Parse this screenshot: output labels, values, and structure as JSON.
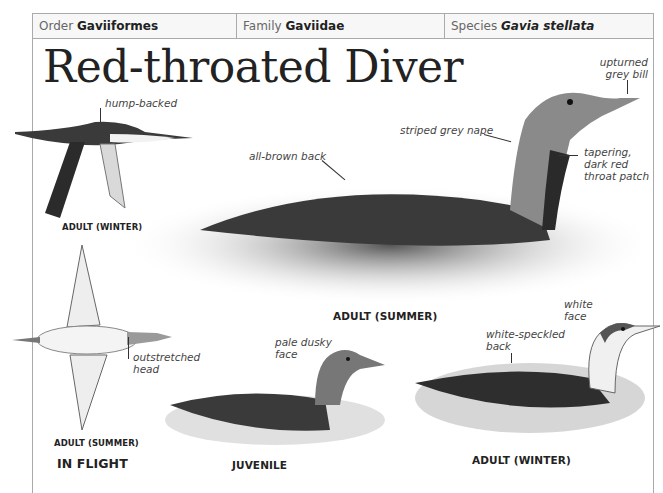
{
  "header": {
    "order": {
      "label": "Order",
      "value": "Gaviiformes"
    },
    "family": {
      "label": "Family",
      "value": "Gaviidae"
    },
    "species": {
      "label": "Species",
      "value": "Gavia stellata"
    }
  },
  "title": "Red-throated Diver",
  "annotations": {
    "hump_backed": "hump-backed",
    "upturned_bill_1": "upturned",
    "upturned_bill_2": "grey bill",
    "striped_nape": "striped grey nape",
    "all_brown_back": "all-brown back",
    "throat_1": "tapering,",
    "throat_2": "dark red",
    "throat_3": "throat patch",
    "outstretched_1": "outstretched",
    "outstretched_2": "head",
    "pale_dusky_1": "pale dusky",
    "pale_dusky_2": "face",
    "white_face_1": "white",
    "white_face_2": "face",
    "speckled_1": "white-speckled",
    "speckled_2": "back"
  },
  "captions": {
    "adult_winter_flight": "ADULT (WINTER)",
    "adult_summer_flight": "ADULT (SUMMER)",
    "in_flight": "IN FLIGHT",
    "adult_summer": "ADULT (SUMMER)",
    "juvenile": "JUVENILE",
    "adult_winter": "ADULT (WINTER)"
  }
}
